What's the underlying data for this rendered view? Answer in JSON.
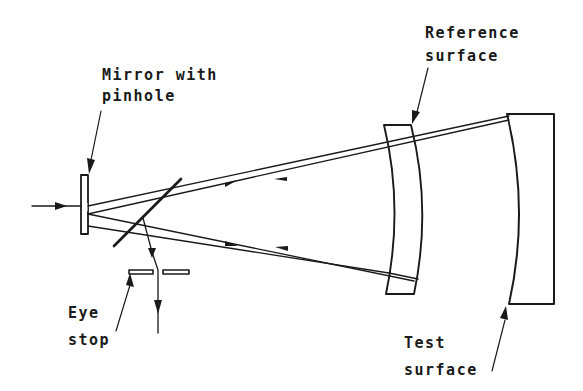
{
  "diagram": {
    "labels": {
      "mirror": [
        "Mirror with",
        "pinhole"
      ],
      "reference": [
        "Reference",
        "surface"
      ],
      "eye_stop": [
        "Eye",
        "stop"
      ],
      "test": [
        "Test",
        "surface"
      ]
    },
    "components": [
      {
        "id": "mirror-with-pinhole",
        "label": "Mirror with pinhole"
      },
      {
        "id": "beam-splitter",
        "label": ""
      },
      {
        "id": "eye-stop",
        "label": "Eye stop"
      },
      {
        "id": "reference-surface",
        "label": "Reference surface"
      },
      {
        "id": "test-surface",
        "label": "Test surface"
      }
    ],
    "colors": {
      "ink": "#1a1a1a",
      "background": "#ffffff"
    }
  }
}
